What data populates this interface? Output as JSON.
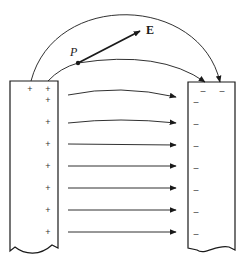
{
  "diagram": {
    "colors": {
      "stroke": "#1a1a1a",
      "background": "#ffffff"
    },
    "labels": {
      "point": "P",
      "field_vector": "E"
    },
    "left_plate": {
      "charge_sign": "+",
      "charges": [
        {
          "x": 30,
          "y": 92
        },
        {
          "x": 48,
          "y": 92
        },
        {
          "x": 48,
          "y": 103
        },
        {
          "x": 48,
          "y": 125
        },
        {
          "x": 48,
          "y": 147
        },
        {
          "x": 48,
          "y": 169
        },
        {
          "x": 48,
          "y": 191
        },
        {
          "x": 48,
          "y": 213
        },
        {
          "x": 48,
          "y": 235
        }
      ]
    },
    "right_plate": {
      "charge_sign": "–",
      "charges": [
        {
          "x": 203,
          "y": 94
        },
        {
          "x": 222,
          "y": 94
        },
        {
          "x": 196,
          "y": 105
        },
        {
          "x": 196,
          "y": 127
        },
        {
          "x": 196,
          "y": 149
        },
        {
          "x": 196,
          "y": 171
        },
        {
          "x": 196,
          "y": 193
        },
        {
          "x": 196,
          "y": 215
        },
        {
          "x": 196,
          "y": 237
        }
      ]
    },
    "field_lines": [
      {
        "name": "outer-arc",
        "path": "M31,81 C55,-10 200,-5 220,82"
      },
      {
        "name": "arc-through-p",
        "path": "M48,81 Q60,68 78,63 Q160,50 205,82"
      },
      {
        "name": "line-1",
        "path": "M68,95 Q120,84 176,97"
      },
      {
        "name": "line-2",
        "path": "M68,123 Q120,117 176,123"
      },
      {
        "name": "line-3",
        "path": "M68,144 L176,145"
      },
      {
        "name": "line-4",
        "path": "M68,166 L176,166"
      },
      {
        "name": "line-5",
        "path": "M68,188 L176,188"
      },
      {
        "name": "line-6",
        "path": "M68,210 L176,210"
      },
      {
        "name": "line-7",
        "path": "M68,232 L176,232"
      }
    ]
  }
}
